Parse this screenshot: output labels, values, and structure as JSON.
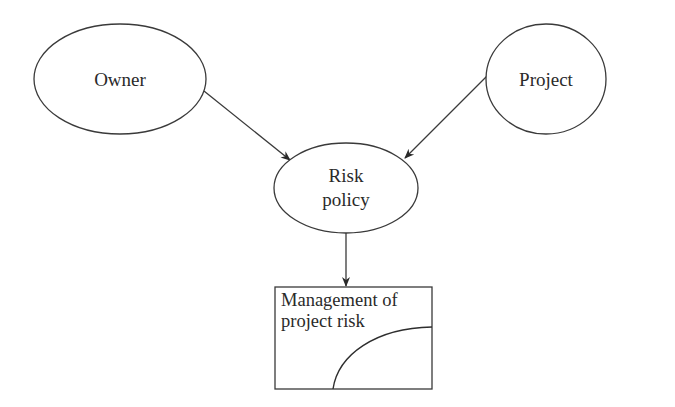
{
  "diagram": {
    "type": "influence-diagram",
    "nodes": {
      "owner": {
        "label": "Owner",
        "shape": "ellipse"
      },
      "project": {
        "label": "Project",
        "shape": "ellipse"
      },
      "risk_policy": {
        "label_line1": "Risk",
        "label_line2": "policy",
        "shape": "ellipse"
      },
      "management": {
        "label_line1": "Management of",
        "label_line2": "project risk",
        "shape": "rectangle"
      }
    },
    "edges": [
      {
        "from": "Owner",
        "to": "Risk policy"
      },
      {
        "from": "Project",
        "to": "Risk policy"
      },
      {
        "from": "Risk policy",
        "to": "Management of project risk"
      }
    ],
    "colors": {
      "stroke": "#3a3a3a",
      "text": "#2a2a2a",
      "background": "#ffffff"
    }
  }
}
